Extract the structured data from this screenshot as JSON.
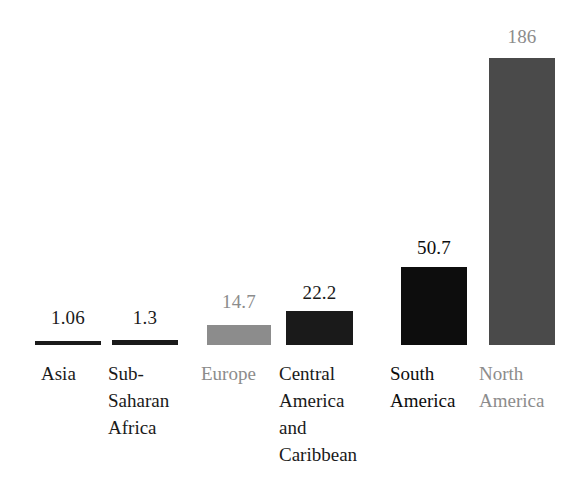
{
  "chart_data": {
    "type": "bar",
    "title": "",
    "subtitle": "",
    "xlabel": "",
    "ylabel": "",
    "ylim": [
      0,
      200
    ],
    "grid": false,
    "legend": false,
    "orientation": "vertical",
    "categories": [
      "Asia",
      "Sub-\nSaharan\nAfrica",
      "Europe",
      "Central\nAmerica\nand\nCaribbean",
      "South\nAmerica",
      "North\nAmerica"
    ],
    "values": [
      1.06,
      1.3,
      14.7,
      22.2,
      50.7,
      186
    ],
    "value_labels": [
      "1.06",
      "1.3",
      "14.7",
      "22.2",
      "50.7",
      "186"
    ],
    "bar_colors": [
      "#1a1a1a",
      "#1a1a1a",
      "#8c8c8c",
      "#1a1a1a",
      "#0d0d0d",
      "#4a4a4a"
    ],
    "label_colors": [
      "#1a1a1a",
      "#1a1a1a",
      "#8c8c8c",
      "#1a1a1a",
      "#0d0d0d",
      "#8c8c8c"
    ],
    "value_label_colors": [
      "#1a1a1a",
      "#1a1a1a",
      "#8c8c8c",
      "#1a1a1a",
      "#0d0d0d",
      "#8c8c8c"
    ],
    "bars": [
      {
        "category": "Asia",
        "value": 1.06,
        "value_label": "1.06",
        "label": "Asia",
        "bar_color": "#1a1a1a",
        "label_color": "#1a1a1a",
        "value_label_color": "#1a1a1a",
        "left": 35,
        "width": 66,
        "top": 341,
        "height": 4,
        "value_top": 307,
        "label_left": 41
      },
      {
        "category": "Sub-Saharan Africa",
        "value": 1.3,
        "value_label": "1.3",
        "label": "Sub-\nSaharan\nAfrica",
        "bar_color": "#1a1a1a",
        "label_color": "#1a1a1a",
        "value_label_color": "#1a1a1a",
        "left": 112,
        "width": 66,
        "top": 340,
        "height": 5,
        "value_top": 307,
        "label_left": 108
      },
      {
        "category": "Europe",
        "value": 14.7,
        "value_label": "14.7",
        "label": "Europe",
        "bar_color": "#8c8c8c",
        "label_color": "#8c8c8c",
        "value_label_color": "#8c8c8c",
        "left": 207,
        "width": 64,
        "top": 325,
        "height": 20,
        "value_top": 291,
        "label_left": 201
      },
      {
        "category": "Central America and Caribbean",
        "value": 22.2,
        "value_label": "22.2",
        "label": "Central\nAmerica\nand\nCaribbean",
        "bar_color": "#1a1a1a",
        "label_color": "#1a1a1a",
        "value_label_color": "#1a1a1a",
        "left": 286,
        "width": 67,
        "top": 311,
        "height": 34,
        "value_top": 282,
        "label_left": 279
      },
      {
        "category": "South America",
        "value": 50.7,
        "value_label": "50.7",
        "label": "South\nAmerica",
        "bar_color": "#0d0d0d",
        "label_color": "#0d0d0d",
        "value_label_color": "#0d0d0d",
        "left": 401,
        "width": 66,
        "top": 267,
        "height": 78,
        "value_top": 237,
        "label_left": 390
      },
      {
        "category": "North America",
        "value": 186,
        "value_label": "186",
        "label": "North\nAmerica",
        "bar_color": "#4a4a4a",
        "label_color": "#8c8c8c",
        "value_label_color": "#8c8c8c",
        "left": 489,
        "width": 66,
        "top": 58,
        "height": 287,
        "value_top": 26,
        "label_left": 479
      }
    ],
    "baseline_y": 345,
    "background_color": "#ffffff"
  }
}
